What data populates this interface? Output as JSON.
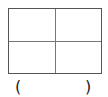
{
  "diagram": {
    "shape": "rectangle divided into 4 equal parts",
    "rows": 2,
    "cols": 2,
    "answer_blank": {
      "open": "(",
      "close": ")",
      "value": ""
    },
    "colors": {
      "line": "#555555",
      "background": "#ffffff"
    }
  }
}
